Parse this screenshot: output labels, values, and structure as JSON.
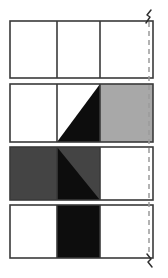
{
  "figure": {
    "title": "",
    "type": "grid-diagram",
    "canvas": {
      "width": 168,
      "height": 278
    },
    "colors": {
      "white": "#ffffff",
      "light_gray": "#a8a8a8",
      "dark_gray": "#444444",
      "black": "#0d0d0d",
      "stroke": "#3a3a3a",
      "dash": "#9a9a9a",
      "background": "#ffffff"
    },
    "geometry": {
      "grid_left": 10,
      "grid_right": 153,
      "col_edges": [
        10,
        57,
        100,
        153
      ],
      "row_bands": [
        {
          "top": 21,
          "bottom": 78
        },
        {
          "top": 84,
          "bottom": 142
        },
        {
          "top": 147,
          "bottom": 200
        },
        {
          "top": 205,
          "bottom": 258
        }
      ],
      "stroke_width": 1.6,
      "centerline_x": 149,
      "centerline_top": 16,
      "centerline_bottom": 264
    },
    "rows": [
      {
        "name": "row-1",
        "cells": [
          {
            "name": "cell-r1c1",
            "fill": "white",
            "split": "none"
          },
          {
            "name": "cell-r1c2",
            "fill": "white",
            "split": "none"
          },
          {
            "name": "cell-r1c3",
            "fill": "white",
            "split": "none"
          }
        ]
      },
      {
        "name": "row-2",
        "cells": [
          {
            "name": "cell-r2c1",
            "fill": "white",
            "split": "none"
          },
          {
            "name": "cell-r2c2",
            "fill": "white",
            "split": "diag-tr-bl",
            "split_fill": "black",
            "split_side": "lower-right"
          },
          {
            "name": "cell-r2c3",
            "fill": "light_gray",
            "split": "none"
          }
        ]
      },
      {
        "name": "row-3",
        "cells": [
          {
            "name": "cell-r3c1",
            "fill": "dark_gray",
            "split": "none"
          },
          {
            "name": "cell-r3c2",
            "fill": "black",
            "split": "diag-tl-br",
            "split_fill": "dark_gray",
            "split_side": "upper-right"
          },
          {
            "name": "cell-r3c3",
            "fill": "white",
            "split": "none"
          }
        ]
      },
      {
        "name": "row-4",
        "cells": [
          {
            "name": "cell-r4c1",
            "fill": "white",
            "split": "none"
          },
          {
            "name": "cell-r4c2",
            "fill": "black",
            "split": "none"
          },
          {
            "name": "cell-r4c3",
            "fill": "white",
            "split": "none"
          }
        ]
      }
    ],
    "centerline": {
      "name": "centerline",
      "style": "dashed",
      "dash_pattern": "5 4",
      "break_symbol_top": true,
      "break_symbol_bottom": true
    }
  }
}
